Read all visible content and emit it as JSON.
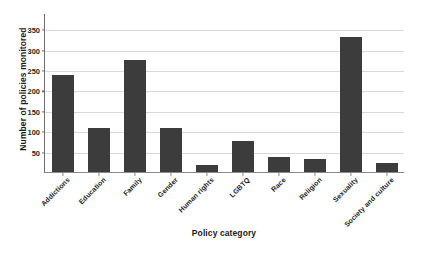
{
  "chart_data": {
    "type": "bar",
    "title": "",
    "xlabel": "Policy category",
    "ylabel": "Number of policies monitored",
    "categories": [
      "Addictions",
      "Education",
      "Family",
      "Gender",
      "Human rights",
      "LGBTQ",
      "Race",
      "Religion",
      "Sexuality",
      "Society and culture"
    ],
    "values": [
      238,
      107,
      274,
      109,
      18,
      75,
      37,
      31,
      330,
      21
    ],
    "ylim": [
      0,
      390
    ],
    "yticks": [
      50,
      100,
      150,
      200,
      250,
      300,
      350
    ],
    "ytick_labels": [
      "50",
      "100",
      "150",
      "200",
      "250",
      "300",
      "350"
    ],
    "grid": true,
    "grid_axis": "y",
    "legend": false,
    "bar_color": "#3c3c3c",
    "gridline_color": "#d9d9d9",
    "axis_color": "#6e6e6e",
    "background_color": "#ffffff"
  }
}
